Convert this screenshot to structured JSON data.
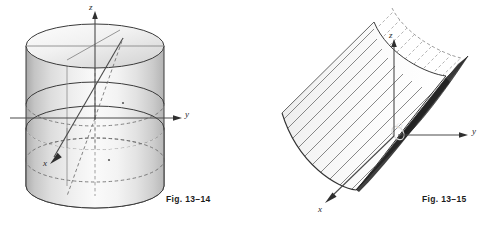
{
  "page": {
    "background_color": "#ffffff",
    "kind": "textbook-figure-pair"
  },
  "figures": [
    {
      "id": "fig-13-14",
      "caption": "Fig. 13–14",
      "subject": "right circular cylinder with axis along z, shown with coordinate axes",
      "shape": "cylinder",
      "axes": {
        "z_label": "z",
        "y_label": "y",
        "x_label": "x"
      },
      "style": {
        "body_light": "#fbfbfb",
        "body_mid": "#dcdcdc",
        "body_dark": "#a9a9a9",
        "top_light": "#fdfdfd",
        "top_dark": "#d2d2d2",
        "outline_color": "#3a3a3a",
        "hidden_line_color": "#6e6e6e",
        "axis_color": "#4a4a4a"
      }
    },
    {
      "id": "fig-13-15",
      "caption": "Fig. 13–15",
      "subject": "parabolic cylinder (trough) opening upward along the x axis, with a dark plane section through the origin",
      "shape": "parabolic-cylinder",
      "axes": {
        "z_label": "z",
        "y_label": "y",
        "x_label": "x",
        "origin_label": "O"
      },
      "style": {
        "trough_light": "#f2f2f2",
        "trough_mid": "#cfcfcf",
        "trough_dark": "#9a9a9a",
        "plane_dark": "#4a4a4a",
        "plane_darker": "#2e2e2e",
        "ruling_solid_color": "#4d4d4d",
        "ruling_dashed_color": "#8c8c8c",
        "outline_color": "#333333",
        "axis_color": "#4a4a4a"
      }
    }
  ]
}
